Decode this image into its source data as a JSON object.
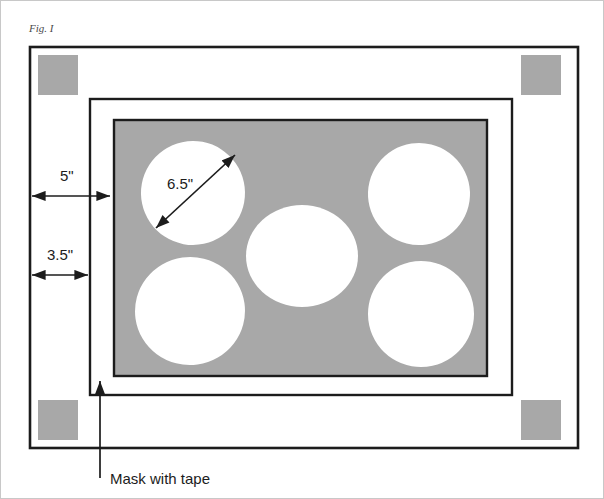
{
  "figure": {
    "caption": "Fig. I",
    "title_label": "Fig. I"
  },
  "colors": {
    "page_background": "#ffffff",
    "panel_gray": "#a8a8a8",
    "corner_square_gray": "#a8a8a8",
    "line_black": "#1c1c1c",
    "hole_white": "#ffffff",
    "caption_gray": "#4a4a4a",
    "page_border_gray": "#c8c8c8"
  },
  "dimensions": [
    {
      "id": "outer-margin",
      "value": "5\"",
      "description": "distance from outer frame edge to middle frame edge"
    },
    {
      "id": "inner-margin",
      "value": "3.5\"",
      "description": "distance from outer frame edge to inner offset"
    },
    {
      "id": "hole-diameter",
      "value": "6.5\"",
      "description": "diameter of each circular cutout"
    }
  ],
  "annotations": [
    {
      "id": "mask-callout",
      "label": "Mask with tape",
      "points_to": "inner frame border"
    }
  ],
  "holes": [
    {
      "id": "hole-top-left",
      "cx": 193,
      "cy": 193,
      "rx": 52,
      "ry": 52,
      "rotate": -12
    },
    {
      "id": "hole-top-right",
      "cx": 419,
      "cy": 194,
      "rx": 51,
      "ry": 51,
      "rotate": 14
    },
    {
      "id": "hole-center",
      "cx": 302,
      "cy": 256,
      "rx": 56,
      "ry": 51,
      "rotate": 0
    },
    {
      "id": "hole-bottom-left",
      "cx": 190,
      "cy": 311,
      "rx": 55,
      "ry": 54,
      "rotate": -8
    },
    {
      "id": "hole-bottom-right",
      "cx": 421,
      "cy": 314,
      "rx": 53,
      "ry": 53,
      "rotate": 10
    }
  ],
  "corner_squares": [
    {
      "id": "corner-top-left",
      "x": 38,
      "y": 55,
      "w": 40,
      "h": 40
    },
    {
      "id": "corner-top-right",
      "x": 521,
      "y": 55,
      "w": 40,
      "h": 40
    },
    {
      "id": "corner-bottom-left",
      "x": 38,
      "y": 400,
      "w": 40,
      "h": 40
    },
    {
      "id": "corner-bottom-right",
      "x": 521,
      "y": 400,
      "w": 40,
      "h": 40
    }
  ],
  "frames": [
    {
      "id": "outer-frame",
      "x": 30,
      "y": 47,
      "w": 548,
      "h": 401
    },
    {
      "id": "middle-frame",
      "x": 90,
      "y": 99,
      "w": 422,
      "h": 296
    },
    {
      "id": "panel-frame",
      "x": 114,
      "y": 120,
      "w": 373,
      "h": 256
    }
  ]
}
